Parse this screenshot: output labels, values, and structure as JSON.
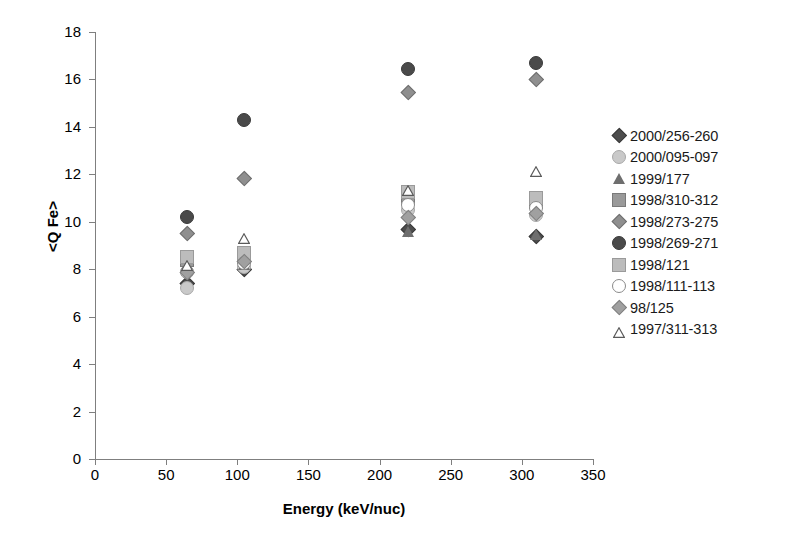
{
  "chart_data": {
    "type": "scatter",
    "title": "",
    "xlabel": "Energy (keV/nuc)",
    "ylabel": "<Q Fe>",
    "xlim": [
      0,
      350
    ],
    "ylim": [
      0,
      18
    ],
    "xticks": [
      0,
      50,
      100,
      150,
      200,
      250,
      300,
      350
    ],
    "yticks": [
      0,
      2,
      4,
      6,
      8,
      10,
      12,
      14,
      16,
      18
    ],
    "grid": false,
    "legend_position": "right",
    "series": [
      {
        "name": "2000/256-260",
        "marker": "diamond",
        "fill": "#4d4d4d",
        "stroke": "#3a3a3a",
        "size": 11,
        "points": [
          {
            "x": 65,
            "y": 7.4
          },
          {
            "x": 105,
            "y": 8.0
          },
          {
            "x": 220,
            "y": 9.7
          },
          {
            "x": 310,
            "y": 9.4
          }
        ]
      },
      {
        "name": "2000/095-097",
        "marker": "circle",
        "fill": "#c9c9c9",
        "stroke": "#a8a8a8",
        "size": 12,
        "points": [
          {
            "x": 65,
            "y": 7.2
          },
          {
            "x": 105,
            "y": 8.1
          },
          {
            "x": 220,
            "y": 10.5
          },
          {
            "x": 310,
            "y": 10.3
          }
        ]
      },
      {
        "name": "1999/177",
        "marker": "triangle",
        "fill": "#6e6e6e",
        "stroke": "#5a5a5a",
        "size": 12,
        "points": [
          {
            "x": 65,
            "y": 8.2
          },
          {
            "x": 105,
            "y": 8.2
          },
          {
            "x": 220,
            "y": 9.6
          },
          {
            "x": 310,
            "y": 9.45
          }
        ]
      },
      {
        "name": "1998/310-312",
        "marker": "square",
        "fill": "#9a9a9a",
        "stroke": "#7a7a7a",
        "size": 12,
        "points": [
          {
            "x": 65,
            "y": 8.4
          },
          {
            "x": 105,
            "y": 8.5
          },
          {
            "x": 220,
            "y": 11.0
          },
          {
            "x": 310,
            "y": 10.85
          }
        ]
      },
      {
        "name": "1998/273-275",
        "marker": "diamond",
        "fill": "#8f8f8f",
        "stroke": "#6f6f6f",
        "size": 11,
        "points": [
          {
            "x": 65,
            "y": 9.5
          },
          {
            "x": 105,
            "y": 11.85
          },
          {
            "x": 220,
            "y": 15.45
          },
          {
            "x": 310,
            "y": 16.0
          }
        ]
      },
      {
        "name": "1998/269-271",
        "marker": "circle",
        "fill": "#4a4a4a",
        "stroke": "#3a3a3a",
        "size": 12,
        "points": [
          {
            "x": 65,
            "y": 10.2
          },
          {
            "x": 105,
            "y": 14.3
          },
          {
            "x": 220,
            "y": 16.45
          },
          {
            "x": 310,
            "y": 16.7
          }
        ]
      },
      {
        "name": "1998/121",
        "marker": "square",
        "fill": "#bcbcbc",
        "stroke": "#9a9a9a",
        "size": 12,
        "points": [
          {
            "x": 65,
            "y": 8.5
          },
          {
            "x": 105,
            "y": 8.7
          },
          {
            "x": 220,
            "y": 11.25
          },
          {
            "x": 310,
            "y": 11.0
          }
        ]
      },
      {
        "name": "1998/111-113",
        "marker": "circle-open",
        "fill": "#ffffff",
        "stroke": "#8a8a8a",
        "size": 12,
        "points": [
          {
            "x": 65,
            "y": 7.9
          },
          {
            "x": 105,
            "y": 8.25
          },
          {
            "x": 220,
            "y": 10.7
          },
          {
            "x": 310,
            "y": 10.6
          }
        ]
      },
      {
        "name": "98/125",
        "marker": "diamond",
        "fill": "#a0a0a0",
        "stroke": "#808080",
        "size": 11,
        "points": [
          {
            "x": 65,
            "y": 7.85
          },
          {
            "x": 105,
            "y": 8.35
          },
          {
            "x": 220,
            "y": 10.2
          },
          {
            "x": 310,
            "y": 10.35
          }
        ]
      },
      {
        "name": "1997/311-313",
        "marker": "triangle-open",
        "fill": "#ffffff",
        "stroke": "#5a5a5a",
        "size": 12,
        "points": [
          {
            "x": 65,
            "y": 8.3
          },
          {
            "x": 105,
            "y": 9.4
          },
          {
            "x": 220,
            "y": 11.45
          },
          {
            "x": 310,
            "y": 12.25
          }
        ]
      }
    ]
  }
}
